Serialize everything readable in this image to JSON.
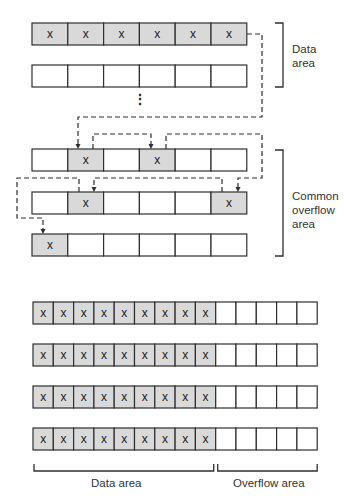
{
  "colors": {
    "filled": "#d9d9d9",
    "empty": "#ffffff",
    "stroke": "#2f2f2f"
  },
  "top_diagram": {
    "cell_mark": "x",
    "rows": [
      {
        "y": 23,
        "filled": [
          0,
          1,
          2,
          3,
          4,
          5
        ]
      },
      {
        "y": 65,
        "filled": []
      },
      {
        "y": 149,
        "filled": [
          1,
          3
        ]
      },
      {
        "y": 192,
        "filled": [
          1,
          5
        ]
      },
      {
        "y": 234,
        "filled": [
          0
        ]
      }
    ],
    "ellipsis": "⋮",
    "labels": {
      "data_area": [
        "Data",
        "area"
      ],
      "common_overflow_area": [
        "Common",
        "overflow",
        "area"
      ]
    }
  },
  "bottom_diagram": {
    "cell_mark": "x",
    "rows": [
      302,
      344,
      386,
      428
    ],
    "data_cells": 9,
    "overflow_cells": 5,
    "labels": {
      "data_area": "Data area",
      "overflow_area": "Overflow area"
    }
  }
}
